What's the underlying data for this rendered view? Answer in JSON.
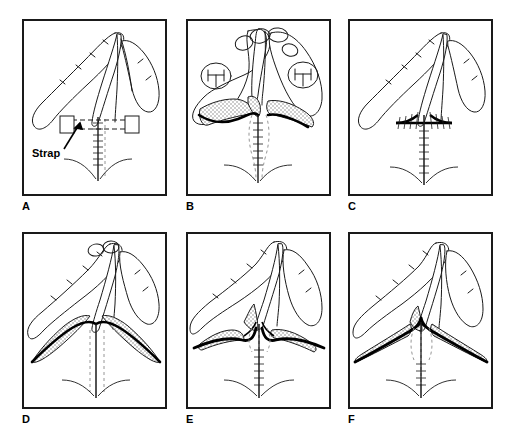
{
  "figure": {
    "background_color": "#ffffff",
    "line_color": "#1a1a1a",
    "stipple_color": "#9a9a9a",
    "frame_color": "#1a1a1a",
    "rows": 2,
    "columns": 3
  },
  "panels": [
    {
      "id": "A",
      "label": "A",
      "caption": "",
      "annotation": {
        "text": "Strap",
        "has_arrow": true
      },
      "features": {
        "digits": 3,
        "stippled_flaps": 0,
        "nail_plates": 0,
        "vertical_suture": true,
        "dashed_midline": true,
        "horizontal_suture": false,
        "strap_band": true,
        "strap_end_blocks": 2,
        "skin_crease": true
      }
    },
    {
      "id": "B",
      "label": "B",
      "caption": "",
      "annotation": null,
      "features": {
        "digits": 3,
        "stippled_flaps": 3,
        "nail_plates": 6,
        "vertical_suture": true,
        "dashed_midline": true,
        "horizontal_suture": false,
        "strap_band": false,
        "strap_end_blocks": 0,
        "skin_crease": true
      }
    },
    {
      "id": "C",
      "label": "C",
      "caption": "",
      "annotation": null,
      "features": {
        "digits": 3,
        "stippled_flaps": 0,
        "nail_plates": 0,
        "vertical_suture": true,
        "dashed_midline": false,
        "horizontal_suture": true,
        "strap_band": false,
        "strap_end_blocks": 0,
        "skin_crease": true
      }
    },
    {
      "id": "D",
      "label": "D",
      "caption": "",
      "annotation": null,
      "features": {
        "digits": 3,
        "stippled_flaps": 2,
        "nail_plates": 2,
        "vertical_suture": true,
        "dashed_midline": true,
        "horizontal_suture": false,
        "strap_band": false,
        "strap_end_blocks": 0,
        "skin_crease": true
      }
    },
    {
      "id": "E",
      "label": "E",
      "caption": "",
      "annotation": null,
      "features": {
        "digits": 3,
        "stippled_flaps": 3,
        "nail_plates": 0,
        "vertical_suture": true,
        "dashed_midline": true,
        "horizontal_suture": false,
        "strap_band": false,
        "strap_end_blocks": 0,
        "skin_crease": true
      }
    },
    {
      "id": "F",
      "label": "F",
      "caption": "",
      "annotation": null,
      "features": {
        "digits": 3,
        "stippled_flaps": 3,
        "nail_plates": 0,
        "vertical_suture": true,
        "dashed_midline": true,
        "horizontal_suture": false,
        "strap_band": false,
        "strap_end_blocks": 0,
        "skin_crease": true
      }
    }
  ]
}
